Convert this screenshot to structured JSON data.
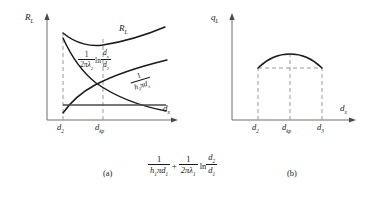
{
  "figure": {
    "panels": [
      {
        "id": "a",
        "caption": "(a)",
        "y_axis_label": "R",
        "y_axis_sub": "L",
        "x_axis_label": "d",
        "x_axis_sub": "x",
        "x_ticks": [
          {
            "label": "d",
            "sub": "2"
          },
          {
            "label": "d",
            "sub": "kp"
          }
        ],
        "curves": [
          {
            "name": "total-resistance",
            "shape": "u-shaped-minimum",
            "label_main": "R",
            "label_sub": "L"
          },
          {
            "name": "conduction-resistance",
            "shape": "increasing-logarithmic",
            "formula": {
              "coeff_num": "1",
              "coeff_den_pre": "2πλ",
              "coeff_den_sub": "2",
              "op": "ln",
              "ratio_num": "d",
              "ratio_num_sub": "x",
              "ratio_den": "d",
              "ratio_den_sub": "2"
            }
          },
          {
            "name": "convection-resistance",
            "shape": "decreasing-hyperbolic",
            "formula": {
              "coeff_num": "1",
              "coeff_den_pre": "h",
              "coeff_den_sub": "3",
              "coeff_den_post": "πd",
              "coeff_den_post_sub": "x"
            }
          },
          {
            "name": "constant-resistance-baseline",
            "shape": "horizontal-line"
          }
        ],
        "caption_formula": {
          "term1": {
            "num": "1",
            "den_pre": "h",
            "den_sub": "1",
            "den_post": "πd",
            "den_post_sub": "1"
          },
          "operator": "+",
          "term2": {
            "num": "1",
            "den_pre": "2πλ",
            "den_sub": "1",
            "op": "ln",
            "ratio_num": "d",
            "ratio_num_sub": "2",
            "ratio_den": "d",
            "ratio_den_sub": "1"
          }
        }
      },
      {
        "id": "b",
        "caption": "(b)",
        "y_axis_label": "q",
        "y_axis_sub": "L",
        "x_axis_label": "d",
        "x_axis_sub": "x",
        "x_ticks": [
          {
            "label": "d",
            "sub": "2"
          },
          {
            "label": "d",
            "sub": "kp"
          },
          {
            "label": "d",
            "sub": "3"
          }
        ],
        "curves": [
          {
            "name": "heat-flow-curve",
            "shape": "inverted-u-maximum"
          },
          {
            "name": "equal-heat-flow-level",
            "shape": "horizontal-dashed-chord"
          }
        ]
      }
    ],
    "colors": {
      "line": "#1a1a1a",
      "dashed": "#8a8a8a",
      "background": "#ffffff"
    }
  }
}
